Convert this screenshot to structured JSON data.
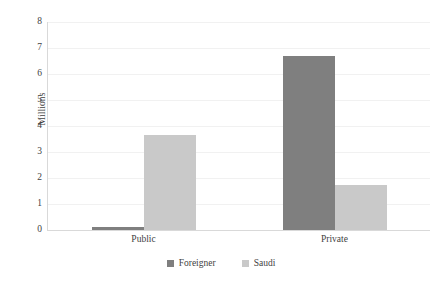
{
  "chart_data": {
    "type": "bar",
    "title": "",
    "subtitle": "",
    "xlabel": "",
    "ylabel": "Millions",
    "categories": [
      "Public",
      "Private"
    ],
    "series": [
      {
        "name": "Foreigner",
        "color": "#7f7f7f",
        "values": [
          0.12,
          6.7
        ]
      },
      {
        "name": "Saudi",
        "color": "#c9c9c9",
        "values": [
          3.65,
          1.75
        ]
      }
    ],
    "ylim": [
      0,
      8
    ],
    "ytick_labels": [
      "8",
      "7",
      "6",
      "5",
      "4",
      "3",
      "2",
      "1",
      "0"
    ],
    "ytick_values": [
      8,
      7,
      6,
      5,
      4,
      3,
      2,
      1,
      0
    ],
    "grid": true,
    "grid_axis": "y",
    "legend": {
      "position": "bottom",
      "entries": [
        {
          "label": "Foreigner",
          "color": "#7f7f7f",
          "marker": "square"
        },
        {
          "label": "Saudi",
          "color": "#c9c9c9",
          "marker": "square"
        }
      ]
    },
    "background_color": "#ffffff",
    "gridline_color": "#f1f1f1",
    "axis_color": "#d9d9d9",
    "text_color": "#3f3f3f"
  }
}
